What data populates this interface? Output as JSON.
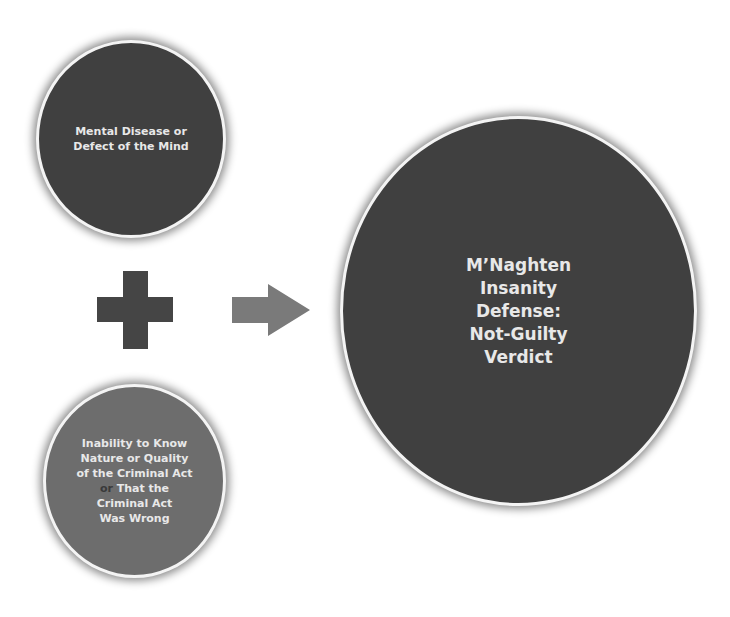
{
  "diagram": {
    "type": "equation-flow",
    "colors": {
      "dark_circle": "#404040",
      "mid_circle": "#6d6d6d",
      "plus": "#454545",
      "arrow": "#7a7a7a",
      "text": "#e8e8e8",
      "or_highlight": "#3a3a3a"
    },
    "element_1": {
      "lines": [
        "Mental Disease or",
        "Defect of the Mind"
      ]
    },
    "operator": {
      "icon": "plus-icon"
    },
    "element_2": {
      "line1": "Inability to Know",
      "line2": "Nature or Quality",
      "line3": "of the Criminal Act",
      "line4_or": "or",
      "line4_rest": " That the",
      "line5": "Criminal Act",
      "line6": "Was Wrong"
    },
    "result_arrow": {
      "icon": "right-arrow-icon"
    },
    "result": {
      "lines": [
        "M’Naghten",
        "Insanity",
        "Defense:",
        "Not-Guilty",
        "Verdict"
      ]
    }
  }
}
